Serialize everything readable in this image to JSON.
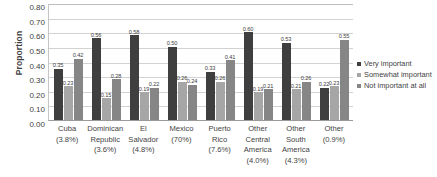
{
  "chart_data": {
    "type": "bar",
    "title": "",
    "xlabel": "",
    "ylabel": "Proportion",
    "ylim": [
      0.0,
      0.8
    ],
    "ytick_labels": [
      "0.80",
      "0.70",
      "0.60",
      "0.50",
      "0.40",
      "0.30",
      "0.20",
      "0.10",
      "0.00"
    ],
    "yticks": [
      0.8,
      0.7,
      0.6,
      0.5,
      0.4,
      0.3,
      0.2,
      0.1,
      0.0
    ],
    "grid": true,
    "legend_position": "right",
    "categories": [
      {
        "name": "Cuba",
        "pct": "(3.8%)"
      },
      {
        "name": "Dominican Republic",
        "pct": "(3.6%)"
      },
      {
        "name": "El Salvador",
        "pct": "(4.8%)"
      },
      {
        "name": "Mexico",
        "pct": "(70%)"
      },
      {
        "name": "Puerto Rico",
        "pct": "(7.6%)"
      },
      {
        "name": "Other Central America",
        "pct": "(4.0%)"
      },
      {
        "name": "Other South America",
        "pct": "(4.3%)"
      },
      {
        "name": "Other",
        "pct": "(0.9%)"
      }
    ],
    "series": [
      {
        "name": "Very important",
        "color": "#3f3f3f",
        "values": [
          0.35,
          0.56,
          0.58,
          0.5,
          0.33,
          0.6,
          0.53,
          0.22
        ],
        "labels": [
          "0.35",
          "0.56",
          "0.58",
          "0.50",
          "0.33",
          "0.60",
          "0.53",
          "0.22"
        ]
      },
      {
        "name": "Somewhat important",
        "color": "#a6a6a6",
        "values": [
          0.23,
          0.15,
          0.19,
          0.26,
          0.26,
          0.19,
          0.21,
          0.23
        ],
        "labels": [
          "0.23",
          "0.15",
          "0.19",
          "0.26",
          "0.26",
          "0.19",
          "0.21",
          "0.23"
        ]
      },
      {
        "name": "Not important at all",
        "color": "#868686",
        "values": [
          0.42,
          0.28,
          0.22,
          0.24,
          0.41,
          0.21,
          0.26,
          0.55
        ],
        "labels": [
          "0.42",
          "0.28",
          "0.22",
          "0.24",
          "0.41",
          "0.21",
          "0.26",
          "0.55"
        ]
      }
    ]
  }
}
